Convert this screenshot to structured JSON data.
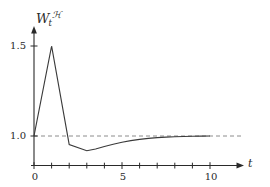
{
  "chart_data": {
    "type": "line",
    "title": "",
    "xlabel": "t",
    "ylabel": "W_t^H",
    "ylabel_base": "W",
    "ylabel_sub": "t",
    "ylabel_sup": "ℋ",
    "xlim": [
      0,
      11.9
    ],
    "ylim": [
      0.83,
      1.62
    ],
    "xticks": [
      0,
      1,
      2,
      3,
      4,
      5,
      6,
      7,
      8,
      9,
      10
    ],
    "xtick_labels": [
      "0",
      "",
      "",
      "",
      "",
      "5",
      "",
      "",
      "",
      "",
      "10"
    ],
    "yticks": [
      1.0,
      1.5
    ],
    "ytick_labels": [
      "1.0",
      "1.5"
    ],
    "grid": false,
    "legend": null,
    "reference_line": {
      "name": "unit-level",
      "y": 1.0,
      "style": "dashed",
      "color": "#8c8c8c"
    },
    "series": [
      {
        "name": "W_t^H",
        "color": "#3a3a3a",
        "x": [
          0,
          1,
          2,
          3,
          3.5,
          4,
          4.5,
          5,
          5.5,
          6,
          6.5,
          7,
          7.5,
          8,
          8.5,
          9,
          9.5,
          10
        ],
        "y": [
          1.0,
          1.5,
          0.952,
          0.918,
          0.928,
          0.942,
          0.954,
          0.965,
          0.974,
          0.981,
          0.987,
          0.991,
          0.994,
          0.996,
          0.9975,
          0.9985,
          0.999,
          1.0
        ]
      }
    ],
    "annotations": []
  },
  "axes": {
    "x_axis_name": "horizontal-time-axis",
    "y_axis_name": "vertical-value-axis",
    "arrow_x": true,
    "arrow_y": true
  }
}
